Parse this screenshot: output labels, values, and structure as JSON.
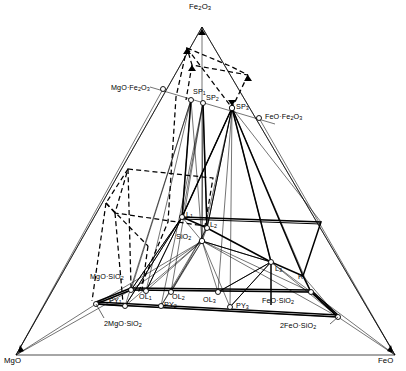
{
  "figure": {
    "type": "ternary-phase-diagram",
    "title": "",
    "background_color": "#ffffff",
    "line_color": "#000000",
    "marker_fill": "#ffffff"
  },
  "corners": {
    "top": {
      "label_html": "Fe<sub>2</sub>O<sub>3</sub>",
      "x": 202,
      "y": 27,
      "label_x": 189,
      "label_y": 3
    },
    "bottom_left": {
      "label_html": "MgO",
      "x": 16,
      "y": 355,
      "label_x": 4,
      "label_y": 357
    },
    "bottom_right": {
      "label_html": "FeO",
      "x": 395,
      "y": 355,
      "label_x": 378,
      "label_y": 357
    }
  },
  "points": [
    {
      "name": "mgo-fe2o3",
      "label_html": "MgO&middot;Fe<sub>2</sub>O<sub>3</sub>",
      "x": 163,
      "y": 89,
      "label_x": 111,
      "label_y": 84,
      "anchor": "right",
      "marker": true
    },
    {
      "name": "feo-fe2o3",
      "label_html": "FeO&middot;Fe<sub>2</sub>O<sub>3</sub>",
      "x": 259,
      "y": 118,
      "label_x": 265,
      "label_y": 113,
      "anchor": "left",
      "marker": true
    },
    {
      "name": "sp1",
      "label_html": "SP<sub>1</sub>",
      "x": 191,
      "y": 100,
      "label_x": 193,
      "label_y": 88,
      "anchor": "left",
      "marker": true
    },
    {
      "name": "sp2",
      "label_html": "SP<sub>2</sub>",
      "x": 203,
      "y": 103,
      "label_x": 206,
      "label_y": 94,
      "anchor": "left",
      "marker": true
    },
    {
      "name": "sp3",
      "label_html": "SP<sub>3</sub>",
      "x": 232,
      "y": 108,
      "label_x": 236,
      "label_y": 103,
      "anchor": "left",
      "marker": true
    },
    {
      "name": "l1",
      "label_html": "L<sub>1</sub>",
      "x": 182,
      "y": 217,
      "label_x": 186,
      "label_y": 212,
      "anchor": "left",
      "marker": true
    },
    {
      "name": "l2",
      "label_html": "L<sub>2</sub>",
      "x": 207,
      "y": 228,
      "label_x": 210,
      "label_y": 222,
      "anchor": "left",
      "marker": true
    },
    {
      "name": "sio2",
      "label_html": "SiO<sub>2</sub>",
      "x": 202,
      "y": 241,
      "label_x": 178,
      "label_y": 234,
      "anchor": "right",
      "marker": true
    },
    {
      "name": "l3",
      "label_html": "L<sub>3</sub>",
      "x": 271,
      "y": 262,
      "label_x": 275,
      "label_y": 266,
      "anchor": "left",
      "marker": true
    },
    {
      "name": "r",
      "label_html": "R",
      "x": 303,
      "y": 276,
      "label_x": 299,
      "label_y": 274,
      "anchor": "left",
      "marker": false
    },
    {
      "name": "mgo-sio2",
      "label_html": "MgO&middot;SiO<sub>2</sub>",
      "x": 131,
      "y": 290,
      "label_x": 91,
      "label_y": 274,
      "anchor": "right",
      "marker": true
    },
    {
      "name": "feo-sio2",
      "label_html": "FeO&middot;SiO<sub>2</sub>",
      "x": 311,
      "y": 292,
      "label_x": 263,
      "label_y": 297,
      "anchor": "right",
      "marker": true
    },
    {
      "name": "py1",
      "label_html": "PY<sub>1</sub>",
      "x": 125,
      "y": 306,
      "label_x": 110,
      "label_y": 297,
      "anchor": "left",
      "marker": true
    },
    {
      "name": "ol1",
      "label_html": "OL<sub>1</sub>",
      "x": 146,
      "y": 291,
      "label_x": 140,
      "label_y": 293,
      "anchor": "left",
      "marker": true
    },
    {
      "name": "ol2",
      "label_html": "OL<sub>2</sub>",
      "x": 171,
      "y": 292,
      "label_x": 172,
      "label_y": 294,
      "anchor": "left",
      "marker": true
    },
    {
      "name": "py2",
      "label_html": "PY<sub>2</sub>",
      "x": 161,
      "y": 306,
      "label_x": 165,
      "label_y": 301,
      "anchor": "left",
      "marker": true
    },
    {
      "name": "ol3",
      "label_html": "OL<sub>3</sub>",
      "x": 218,
      "y": 292,
      "label_x": 204,
      "label_y": 296,
      "anchor": "left",
      "marker": true
    },
    {
      "name": "py3",
      "label_html": "PY<sub>3</sub>",
      "x": 230,
      "y": 307,
      "label_x": 236,
      "label_y": 302,
      "anchor": "left",
      "marker": true
    },
    {
      "name": "2mgo-sio2",
      "label_html": "2MgO&middot;SiO<sub>2</sub>",
      "x": 96,
      "y": 304,
      "label_x": 98,
      "label_y": 320,
      "anchor": "left",
      "marker": true
    },
    {
      "name": "2feo-sio2",
      "label_html": "2FeO&middot;SiO<sub>2</sub>",
      "x": 338,
      "y": 317,
      "label_x": 282,
      "label_y": 323,
      "anchor": "right",
      "marker": true
    }
  ],
  "chart_data": {
    "type": "scatter",
    "xlabel": "",
    "ylabel": "",
    "legend": [],
    "components": [
      "Fe2O3",
      "MgO",
      "FeO"
    ],
    "phase_labels": [
      "Fe2O3",
      "MgO",
      "FeO",
      "MgO·Fe2O3",
      "FeO·Fe2O3",
      "SP1",
      "SP2",
      "SP3",
      "L1",
      "L2",
      "L3",
      "R",
      "SiO2",
      "MgO·SiO2",
      "FeO·SiO2",
      "PY1",
      "PY2",
      "PY3",
      "OL1",
      "OL2",
      "OL3",
      "2MgO·SiO2",
      "2FeO·SiO2"
    ],
    "marker_count": 20,
    "grid": false
  }
}
